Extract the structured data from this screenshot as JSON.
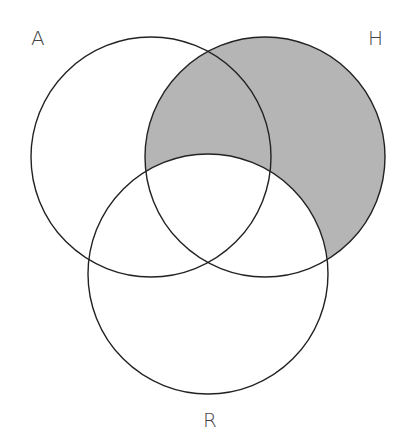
{
  "diagram": {
    "type": "venn",
    "sets": [
      {
        "id": "A",
        "label": "A",
        "cx": 151,
        "cy": 157,
        "r": 120
      },
      {
        "id": "H",
        "label": "H",
        "cx": 265,
        "cy": 157,
        "r": 120
      },
      {
        "id": "R",
        "label": "R",
        "cx": 208,
        "cy": 274,
        "r": 120
      }
    ],
    "shaded_region": "H − R",
    "colors": {
      "shade": "#b5b5b5",
      "stroke": "#222222",
      "label": "#444444"
    }
  }
}
